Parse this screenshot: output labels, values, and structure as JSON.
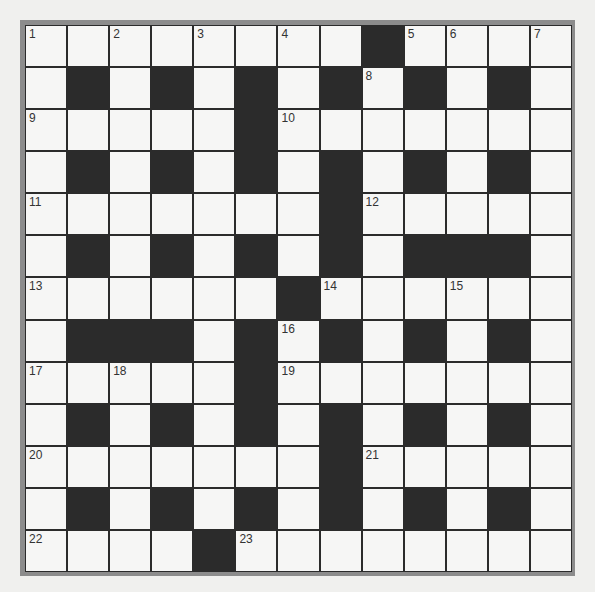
{
  "puzzle": {
    "rows": 13,
    "cols": 13,
    "layout": [
      "WWWWWWWWBWWWW",
      "WBWBWBWBWBWBW",
      "WWWWWBWWWWWWW",
      "WBWBWBWBWBWBW",
      "WWWWWWWBWWWWW",
      "WBWBWBWBWBBBW",
      "WWWWWWBWWWWWW",
      "WBBBWBWBWBWBW",
      "WWWWWBWWWWWWW",
      "WBWBWBWBWBWBW",
      "WWWWWWWBWWWWW",
      "WBWBWBWBWBWBW",
      "WWWWBWWWWWWWW"
    ],
    "numbers": [
      {
        "row": 0,
        "col": 0,
        "n": "1"
      },
      {
        "row": 0,
        "col": 2,
        "n": "2"
      },
      {
        "row": 0,
        "col": 4,
        "n": "3"
      },
      {
        "row": 0,
        "col": 6,
        "n": "4"
      },
      {
        "row": 0,
        "col": 9,
        "n": "5"
      },
      {
        "row": 0,
        "col": 10,
        "n": "6"
      },
      {
        "row": 0,
        "col": 12,
        "n": "7"
      },
      {
        "row": 1,
        "col": 8,
        "n": "8"
      },
      {
        "row": 2,
        "col": 0,
        "n": "9"
      },
      {
        "row": 2,
        "col": 6,
        "n": "10"
      },
      {
        "row": 4,
        "col": 0,
        "n": "11"
      },
      {
        "row": 4,
        "col": 8,
        "n": "12"
      },
      {
        "row": 6,
        "col": 0,
        "n": "13"
      },
      {
        "row": 6,
        "col": 7,
        "n": "14"
      },
      {
        "row": 6,
        "col": 10,
        "n": "15"
      },
      {
        "row": 7,
        "col": 6,
        "n": "16"
      },
      {
        "row": 8,
        "col": 0,
        "n": "17"
      },
      {
        "row": 8,
        "col": 2,
        "n": "18"
      },
      {
        "row": 8,
        "col": 6,
        "n": "19"
      },
      {
        "row": 10,
        "col": 0,
        "n": "20"
      },
      {
        "row": 10,
        "col": 8,
        "n": "21"
      },
      {
        "row": 12,
        "col": 0,
        "n": "22"
      },
      {
        "row": 12,
        "col": 5,
        "n": "23"
      }
    ]
  },
  "colors": {
    "block": "#2b2b2b",
    "cell": "#f6f6f5",
    "frame": "#8c8c8c",
    "number": "#333333"
  }
}
